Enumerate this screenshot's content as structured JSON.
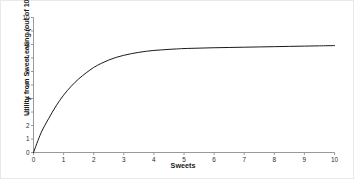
{
  "chart_data": {
    "type": "line",
    "title": "",
    "subtitle": "",
    "xlabel": "Sweets",
    "ylabel": "Utility from Sweet eating (out of 10)",
    "xlim": [
      0,
      10
    ],
    "ylim": [
      0,
      10
    ],
    "grid": false,
    "legend": false,
    "legend_position": "none",
    "xticks": [
      "0",
      "1",
      "2",
      "3",
      "4",
      "5",
      "6",
      "7",
      "8",
      "9",
      "10"
    ],
    "yticks": [
      "0",
      "1",
      "2",
      "3",
      "4",
      "5",
      "6",
      "7",
      "8",
      "9",
      "10"
    ],
    "line_color": "#1a1a1a",
    "axis_color": "#999999",
    "series": [
      {
        "name": "Total utility from sweets",
        "x": [
          0,
          0.25,
          0.5,
          0.75,
          1,
          1.25,
          1.5,
          1.75,
          2,
          2.25,
          2.5,
          2.75,
          3,
          3.25,
          3.5,
          3.75,
          4,
          4.25,
          4.5,
          4.75,
          5,
          5.5,
          6,
          6.5,
          7,
          7.5,
          8,
          8.5,
          9,
          9.5,
          10
        ],
        "values": [
          0,
          1.45,
          2.5,
          3.45,
          4.25,
          4.9,
          5.45,
          5.9,
          6.3,
          6.6,
          6.85,
          7.05,
          7.2,
          7.32,
          7.42,
          7.5,
          7.56,
          7.6,
          7.64,
          7.67,
          7.7,
          7.73,
          7.76,
          7.78,
          7.8,
          7.82,
          7.84,
          7.86,
          7.88,
          7.9,
          7.92
        ]
      }
    ]
  },
  "axes": {
    "x_title": "Sweets",
    "y_title": "Utility from Sweet eating (out of 10)"
  }
}
